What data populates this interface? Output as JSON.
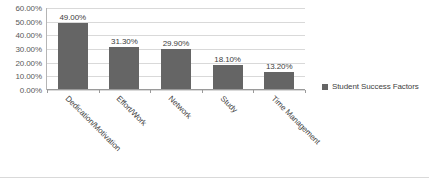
{
  "chart_data": {
    "type": "bar",
    "title": "",
    "xlabel": "",
    "ylabel": "",
    "categories": [
      "Dedication/Motivation",
      "Effort/Work",
      "Network",
      "Study",
      "Time Management"
    ],
    "values": [
      49.0,
      31.3,
      29.9,
      18.1,
      13.2
    ],
    "data_labels": [
      "49.00%",
      "31.30%",
      "29.90%",
      "18.10%",
      "13.20%"
    ],
    "series": [
      {
        "name": "Student Success Factors",
        "values": [
          49.0,
          31.3,
          29.9,
          18.1,
          13.2
        ],
        "color": "#656565"
      }
    ],
    "ylim": [
      0,
      60
    ],
    "y_ticks": [
      60,
      50,
      40,
      30,
      20,
      10,
      0
    ],
    "y_tick_labels": [
      "60.00%",
      "50.00%",
      "40.00%",
      "30.00%",
      "20.00%",
      "10.00%",
      "0.00%"
    ],
    "grid": true,
    "legend_position": "right",
    "legend_entries": [
      "Student Success Factors"
    ]
  },
  "legend": {
    "label": "Student Success Factors"
  },
  "colors": {
    "bar": "#656565",
    "gridline": "#d9d9d9",
    "axis": "#9a9a9a",
    "text": "#404040",
    "background": "#ffffff"
  }
}
